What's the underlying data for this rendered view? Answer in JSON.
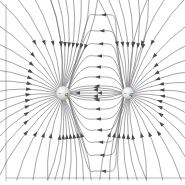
{
  "figure": {
    "name": "electric-field-lines-two-like-charges",
    "caption": "",
    "background_color": "#ffffff",
    "line_color": "#6e6e72",
    "arrow_color": "#4a4a4e",
    "frame_color": "#b9b9b9"
  },
  "frame": {
    "left_rule": {
      "x": 6,
      "y1": 4,
      "y2": 181
    },
    "bottom_rule": {
      "y": 178,
      "x1": 6,
      "x2": 185
    }
  },
  "charges": [
    {
      "id": "charge-left",
      "label": "q",
      "sign": "−",
      "cx": 63,
      "cy": 93,
      "r": 7.2,
      "fill_center": "#f2f2f0",
      "fill_edge": "#a8a8a4",
      "polarity": "negative"
    },
    {
      "id": "charge-right",
      "label": "q",
      "sign": "−",
      "cx": 128,
      "cy": 93,
      "r": 6.2,
      "fill_center": "#f6f6f4",
      "fill_edge": "#b0b0ac",
      "polarity": "negative"
    }
  ],
  "field": {
    "type": "dipole-like-charges",
    "direction": "inward",
    "description": "Field lines converge on both point charges",
    "spoke_count_left": 34,
    "spoke_count_right": 30,
    "arc_count": 14,
    "axis_y": 93
  },
  "chart_data": {
    "type": "line",
    "title": "",
    "xlabel": "",
    "ylabel": "",
    "series": [
      {
        "name": "field-lines-left-charge",
        "values": []
      },
      {
        "name": "field-lines-right-charge",
        "values": []
      },
      {
        "name": "connecting-arcs",
        "values": []
      }
    ]
  }
}
